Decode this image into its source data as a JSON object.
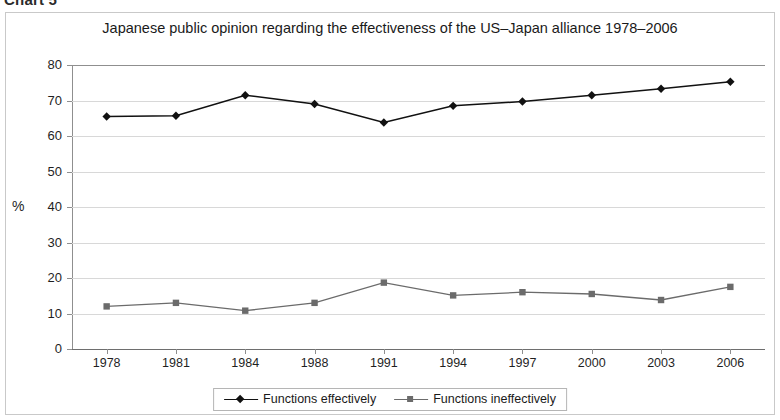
{
  "caption": "Chart 5",
  "chart_data": {
    "type": "line",
    "title": "Japanese public opinion regarding the effectiveness of the US–Japan alliance 1978–2006",
    "xlabel": "",
    "ylabel": "%",
    "categories": [
      "1978",
      "1981",
      "1984",
      "1988",
      "1991",
      "1994",
      "1997",
      "2000",
      "2003",
      "2006"
    ],
    "yticks": [
      "0",
      "10",
      "20",
      "30",
      "40",
      "50",
      "60",
      "70",
      "80"
    ],
    "ylim": [
      0,
      80
    ],
    "grid": true,
    "legend_position": "bottom",
    "series": [
      {
        "name": "Functions effectively",
        "marker": "diamond",
        "color": "#111111",
        "values": [
          65.5,
          65.7,
          71.5,
          69.0,
          63.8,
          68.5,
          69.7,
          71.5,
          73.3,
          75.3
        ]
      },
      {
        "name": "Functions ineffectively",
        "marker": "square",
        "color": "#6b6b6b",
        "values": [
          12.0,
          13.0,
          10.8,
          13.0,
          18.7,
          15.1,
          16.0,
          15.5,
          13.8,
          17.5
        ]
      }
    ]
  }
}
